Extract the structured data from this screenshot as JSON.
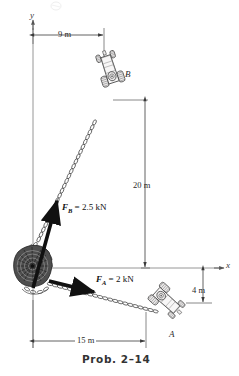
{
  "figure": {
    "caption": "Prob. 2–14",
    "background": "#ffffff",
    "ink": "#1a1a1a",
    "axes": {
      "y_label": "y",
      "x_label": "x",
      "origin_px": [
        33,
        268
      ]
    },
    "labels": {
      "point_a": "A",
      "point_b": "B"
    },
    "dimensions": [
      {
        "name": "horizontal-offset-b",
        "text": "9 m",
        "value": 9,
        "unit": "m",
        "orientation": "horizontal"
      },
      {
        "name": "vertical-offset-b",
        "text": "20 m",
        "value": 20,
        "unit": "m",
        "orientation": "vertical"
      },
      {
        "name": "vertical-offset-a",
        "text": "4 m",
        "value": 4,
        "unit": "m",
        "orientation": "vertical"
      },
      {
        "name": "horizontal-offset-a",
        "text": "15 m",
        "value": 15,
        "unit": "m",
        "orientation": "horizontal"
      }
    ],
    "forces": [
      {
        "name": "force-b",
        "symbol": "F",
        "subscript": "B",
        "equals": "=",
        "magnitude": "2.5",
        "unit": "kN",
        "full_text": "F_B = 2.5 kN",
        "direction": "up-and-to-the-right",
        "applied_at": "stump at origin",
        "toward": "B"
      },
      {
        "name": "force-a",
        "symbol": "F",
        "subscript": "A",
        "equals": "=",
        "magnitude": "2",
        "unit": "kN",
        "full_text": "F_A = 2 kN",
        "direction": "down-and-to-the-right",
        "applied_at": "stump at origin",
        "toward": "A"
      }
    ],
    "objects": [
      {
        "name": "tree-stump",
        "position": "origin"
      },
      {
        "name": "tractor-b",
        "position": "upper-right",
        "label": "B"
      },
      {
        "name": "tractor-a",
        "position": "lower-right",
        "label": "A"
      },
      {
        "name": "chain-b",
        "from": "tree-stump",
        "to": "tractor-b"
      },
      {
        "name": "chain-a",
        "from": "tree-stump",
        "to": "tractor-a"
      }
    ]
  }
}
